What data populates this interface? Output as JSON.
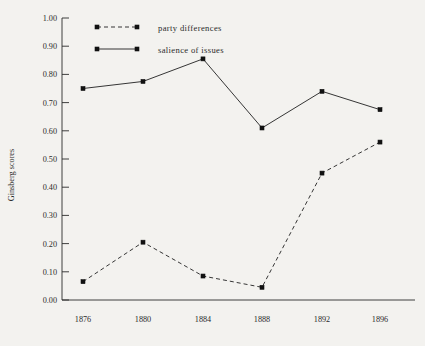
{
  "chart_data": {
    "type": "line",
    "title": "",
    "xlabel": "",
    "ylabel": "Ginsberg scores",
    "categories": [
      "1876",
      "1880",
      "1884",
      "1888",
      "1892",
      "1896"
    ],
    "x": [
      1876,
      1880,
      1884,
      1888,
      1892,
      1896
    ],
    "ylim": [
      0.0,
      1.0
    ],
    "ytick_step": 0.1,
    "yticks": [
      "0.00",
      "0.10",
      "0.20",
      "0.30",
      "0.40",
      "0.50",
      "0.60",
      "0.70",
      "0.80",
      "0.90",
      "1.00"
    ],
    "grid": false,
    "legend_position": "top-left-inside",
    "series": [
      {
        "name": "party differences",
        "style": "dashed",
        "marker": "filled-square",
        "color": "#2b2b2b",
        "values": [
          0.065,
          0.205,
          0.085,
          0.045,
          0.45,
          0.56
        ]
      },
      {
        "name": "salience of issues",
        "style": "solid",
        "marker": "filled-square",
        "color": "#2b2b2b",
        "values": [
          0.75,
          0.775,
          0.855,
          0.61,
          0.74,
          0.675
        ]
      }
    ]
  },
  "legend": {
    "entries": [
      {
        "label": "party differences",
        "style": "dashed"
      },
      {
        "label": "salience of issues",
        "style": "solid"
      }
    ]
  },
  "axes": {
    "y_title": "Ginsberg scores"
  }
}
